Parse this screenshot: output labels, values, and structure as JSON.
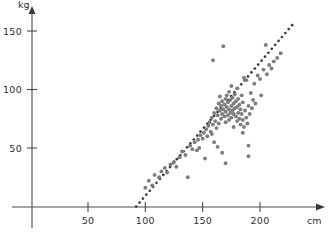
{
  "chart_data": {
    "type": "scatter",
    "title": "",
    "subtitle": "",
    "xlabel": "cm",
    "ylabel": "kg",
    "xlim": [
      0,
      240
    ],
    "ylim": [
      0,
      165
    ],
    "xticks": [
      50,
      100,
      150,
      200
    ],
    "yticks": [
      50,
      100,
      150
    ],
    "xtick_labels": [
      "50",
      "100",
      "150",
      "200"
    ],
    "ytick_labels": [
      "50",
      "100",
      "150"
    ],
    "grid": false,
    "legend": null,
    "point_color": "#7e7e82",
    "trendline_color": "#3d3d3d",
    "axis_color": "#4a4a4a",
    "series": [
      {
        "name": "height-weight observations",
        "marker": "circle",
        "points": [
          [
            100,
            16
          ],
          [
            103,
            22
          ],
          [
            106,
            18
          ],
          [
            108,
            27
          ],
          [
            112,
            25
          ],
          [
            114,
            30
          ],
          [
            117,
            33
          ],
          [
            119,
            29
          ],
          [
            122,
            36
          ],
          [
            125,
            38
          ],
          [
            127,
            34
          ],
          [
            130,
            42
          ],
          [
            132,
            47
          ],
          [
            135,
            44
          ],
          [
            137,
            25
          ],
          [
            139,
            52
          ],
          [
            141,
            49
          ],
          [
            143,
            55
          ],
          [
            145,
            48
          ],
          [
            146,
            57
          ],
          [
            147,
            50
          ],
          [
            148,
            61
          ],
          [
            150,
            58
          ],
          [
            151,
            63
          ],
          [
            152,
            41
          ],
          [
            153,
            66
          ],
          [
            154,
            60
          ],
          [
            155,
            69
          ],
          [
            156,
            72
          ],
          [
            157,
            64
          ],
          [
            158,
            76
          ],
          [
            159,
            70
          ],
          [
            159,
            125
          ],
          [
            160,
            55
          ],
          [
            160,
            80
          ],
          [
            161,
            73
          ],
          [
            162,
            67
          ],
          [
            162,
            84
          ],
          [
            163,
            78
          ],
          [
            164,
            88
          ],
          [
            164,
            71
          ],
          [
            165,
            82
          ],
          [
            165,
            94
          ],
          [
            166,
            75
          ],
          [
            166,
            86
          ],
          [
            167,
            79
          ],
          [
            167,
            90
          ],
          [
            168,
            83
          ],
          [
            168,
            137
          ],
          [
            169,
            77
          ],
          [
            169,
            87
          ],
          [
            170,
            81
          ],
          [
            170,
            92
          ],
          [
            170,
            72
          ],
          [
            171,
            85
          ],
          [
            171,
            95
          ],
          [
            172,
            78
          ],
          [
            172,
            89
          ],
          [
            173,
            74
          ],
          [
            173,
            83
          ],
          [
            173,
            98
          ],
          [
            174,
            80
          ],
          [
            174,
            91
          ],
          [
            175,
            76
          ],
          [
            175,
            86
          ],
          [
            175,
            103
          ],
          [
            176,
            82
          ],
          [
            176,
            93
          ],
          [
            177,
            79
          ],
          [
            177,
            88
          ],
          [
            178,
            84
          ],
          [
            178,
            96
          ],
          [
            179,
            77
          ],
          [
            179,
            90
          ],
          [
            180,
            73
          ],
          [
            180,
            85
          ],
          [
            180,
            101
          ],
          [
            181,
            80
          ],
          [
            181,
            92
          ],
          [
            182,
            75
          ],
          [
            182,
            87
          ],
          [
            183,
            70
          ],
          [
            183,
            83
          ],
          [
            184,
            79
          ],
          [
            184,
            95
          ],
          [
            185,
            74
          ],
          [
            185,
            89
          ],
          [
            186,
            68
          ],
          [
            186,
            110
          ],
          [
            187,
            82
          ],
          [
            188,
            76
          ],
          [
            188,
            108
          ],
          [
            189,
            71
          ],
          [
            190,
            86
          ],
          [
            190,
            52
          ],
          [
            191,
            79
          ],
          [
            192,
            97
          ],
          [
            193,
            84
          ],
          [
            194,
            91
          ],
          [
            195,
            105
          ],
          [
            196,
            88
          ],
          [
            198,
            112
          ],
          [
            200,
            109
          ],
          [
            201,
            95
          ],
          [
            203,
            117
          ],
          [
            205,
            138
          ],
          [
            206,
            113
          ],
          [
            208,
            121
          ],
          [
            210,
            118
          ],
          [
            212,
            124
          ],
          [
            215,
            127
          ],
          [
            218,
            131
          ],
          [
            167,
            46
          ],
          [
            170,
            37
          ],
          [
            163,
            51
          ],
          [
            158,
            62
          ],
          [
            190,
            43
          ],
          [
            177,
            68
          ],
          [
            185,
            63
          ]
        ]
      }
    ],
    "trendline": {
      "style": "dotted",
      "x_start": 92,
      "y_start": 0,
      "x_end": 228,
      "y_end": 155,
      "dot_count": 46
    }
  },
  "axes": {
    "y_unit_label": "kg",
    "x_unit_label": "cm"
  }
}
